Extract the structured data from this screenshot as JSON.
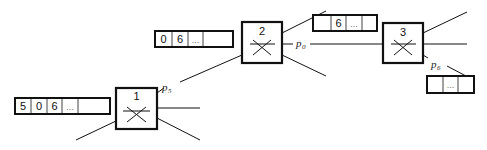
{
  "diagram": {
    "type": "network-of-switches-with-queues",
    "switches": [
      {
        "id": "1",
        "label": "1"
      },
      {
        "id": "2",
        "label": "2"
      },
      {
        "id": "3",
        "label": "3"
      }
    ],
    "queues": [
      {
        "id": "q1",
        "feeds": "1",
        "cells": [
          "5",
          "0",
          "6",
          "…",
          ""
        ]
      },
      {
        "id": "q2",
        "feeds": "2",
        "cells": [
          "0",
          "6",
          "…",
          ""
        ]
      },
      {
        "id": "q3",
        "between": "2-3",
        "cells": [
          "",
          "6",
          "…",
          ""
        ]
      },
      {
        "id": "q4",
        "from": "3",
        "cells": [
          "",
          "…",
          ""
        ]
      }
    ],
    "ports": [
      {
        "switch": "1",
        "label": "p",
        "sub": "5"
      },
      {
        "switch": "2",
        "label": "p",
        "sub": "0"
      },
      {
        "switch": "3",
        "label": "p",
        "sub": "6"
      }
    ],
    "colors": {
      "stroke": "#111111",
      "background": "#ffffff",
      "cell_text": "#111111"
    }
  }
}
